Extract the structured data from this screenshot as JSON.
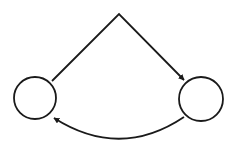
{
  "diagram": {
    "background": "#ffffff",
    "stroke_color": "#1a1a1a",
    "stroke_width": 1.8,
    "nodes": [
      {
        "id": "left-node",
        "cx": 35,
        "cy": 98,
        "r": 21,
        "label": ""
      },
      {
        "id": "right-node",
        "cx": 201,
        "cy": 99,
        "r": 22,
        "label": ""
      }
    ],
    "edges": [
      {
        "id": "top-edge",
        "from": "left-node",
        "to": "right-node",
        "shape": "angled",
        "apex": [
          119,
          14
        ],
        "arrow_at": "right-node"
      },
      {
        "id": "bottom-edge",
        "from": "right-node",
        "to": "left-node",
        "shape": "curved",
        "arrow_at": "left-node"
      }
    ]
  }
}
